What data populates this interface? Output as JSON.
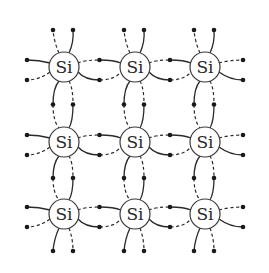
{
  "diagram": {
    "atom_label": "Si",
    "grid": {
      "rows": 3,
      "cols": 3,
      "col_x": [
        64,
        135,
        205
      ],
      "row_y": [
        67,
        142,
        214
      ],
      "atom_radius": 15
    },
    "electron_offsets": {
      "vertical_pair_dx": [
        -11,
        9
      ],
      "horizontal_pair_dy": [
        -7,
        13
      ],
      "outer_top_y": 30,
      "outer_bottom_y": 251,
      "outer_left_x": 27,
      "outer_right_x": 243
    },
    "bond_styles": {
      "top_outer": [
        "dashed",
        "solid"
      ],
      "bottom_outer": [
        "solid",
        "dashed"
      ],
      "left_outer": [
        "solid",
        "dashed"
      ],
      "right_outer": [
        "dashed",
        "solid"
      ],
      "horizontal_shared_upper": [
        "dashed",
        "solid"
      ],
      "horizontal_shared_lower": [
        "solid",
        "dashed"
      ],
      "vertical_shared_left": [
        "solid",
        "dashed"
      ],
      "vertical_shared_right": [
        "dashed",
        "solid"
      ]
    },
    "colors": {
      "line": "#2a2a2a",
      "electron": "#1a1a1a",
      "background": "#ffffff"
    }
  }
}
